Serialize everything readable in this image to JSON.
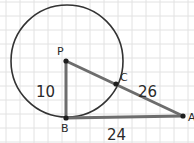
{
  "diagram": {
    "grid": {
      "spacing": 14,
      "offset_x": 6,
      "offset_y": 2,
      "color": "#e2e2e2"
    },
    "circle": {
      "center_label": "P",
      "cx": 67,
      "cy": 61,
      "r": 56,
      "stroke": "#333333"
    },
    "points": [
      {
        "id": "P",
        "label": "P",
        "x": 66,
        "y": 61,
        "label_x": 57,
        "label_y": 55
      },
      {
        "id": "B",
        "label": "B",
        "x": 66,
        "y": 118,
        "label_x": 61,
        "label_y": 132
      },
      {
        "id": "A",
        "label": "A",
        "x": 183,
        "y": 116,
        "label_x": 188,
        "label_y": 121
      },
      {
        "id": "C",
        "label": "C",
        "x": 116,
        "y": 84,
        "label_x": 120,
        "label_y": 81
      }
    ],
    "segments": [
      {
        "from": "P",
        "to": "B",
        "measure": "10"
      },
      {
        "from": "B",
        "to": "A",
        "measure": "24"
      },
      {
        "from": "P",
        "to": "A",
        "measure": ""
      }
    ],
    "measurements": [
      {
        "segment": "PB",
        "text": "10",
        "x": 36,
        "y": 97
      },
      {
        "segment": "CA",
        "text": "26",
        "x": 138,
        "y": 97
      },
      {
        "segment": "BA",
        "text": "24",
        "x": 107,
        "y": 140
      }
    ],
    "segment_color": "#6d6d6d",
    "dot_color": "#1e1e1e"
  }
}
